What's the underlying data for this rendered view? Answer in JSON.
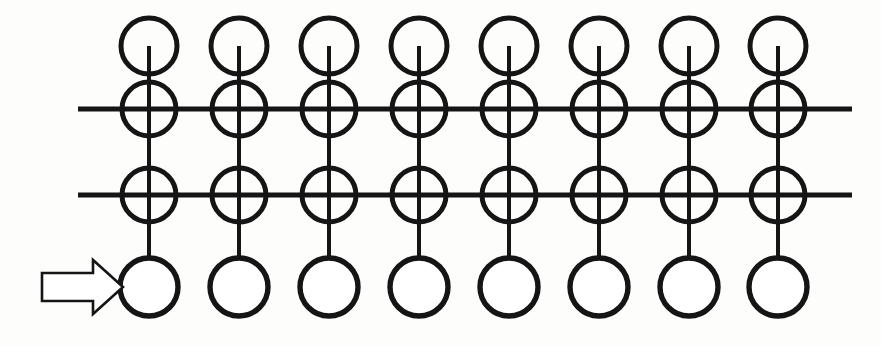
{
  "canvas": {
    "width": 881,
    "height": 346,
    "background_color": "#fdfdfc",
    "ink_color": "#151515",
    "figure_kind": "technical-line-diagram",
    "description": "Patent-style schematic: eight identical vertical element columns, each carrying four circles threaded on a vertical stem, intersected by two long horizontal rails; a hollow block arrow at far left points to the lower-left circle."
  },
  "geometry": {
    "column_count": 8,
    "column_centers_x": [
      149,
      239,
      329,
      419,
      509,
      599,
      689,
      778
    ],
    "circle_rows": [
      {
        "name": "top-node",
        "center_y": 46,
        "radius": 28,
        "stroke_width": 5.0,
        "on_rail": false
      },
      {
        "name": "upper-rail-node",
        "center_y": 109,
        "radius": 27,
        "stroke_width": 5.0,
        "on_rail": true
      },
      {
        "name": "lower-rail-node",
        "center_y": 195,
        "radius": 27,
        "stroke_width": 5.0,
        "on_rail": true
      },
      {
        "name": "bottom-node",
        "center_y": 287,
        "radius": 29,
        "stroke_width": 5.4,
        "on_rail": false
      }
    ],
    "stem": {
      "start_y": 46,
      "end_y": 258,
      "stroke_width": 4.0,
      "note": "vertical stem begins at the centre of the top circle and terminates at the top of the bottom circle"
    },
    "rails": [
      {
        "name": "upper-rail",
        "y": 109,
        "x_start": 78,
        "x_end": 852,
        "stroke_width": 5.0
      },
      {
        "name": "lower-rail",
        "y": 195,
        "x_start": 78,
        "x_end": 852,
        "stroke_width": 5.0
      }
    ],
    "arrow": {
      "name": "left-pointer-arrow",
      "style": "hollow outline block arrow",
      "direction": "right",
      "tail_x": 42,
      "tip_x": 123,
      "shaft_top_y": 273,
      "shaft_bottom_y": 301,
      "head_start_x": 93,
      "head_top_y": 260,
      "head_bottom_y": 314,
      "points_at": "bottom-node of column 1"
    }
  },
  "labels": {
    "text_items": []
  }
}
